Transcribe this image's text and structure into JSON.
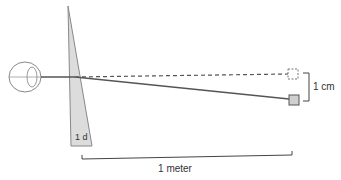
{
  "diagram": {
    "prism_label": "1 d",
    "displacement_label": "1 cm",
    "distance_label": "1 meter",
    "colors": {
      "line": "#555555",
      "prism_fill": "#d9d9d9",
      "prism_stroke": "#888888",
      "eye_stroke": "#888888",
      "target_fill": "#d0d0d0"
    }
  }
}
